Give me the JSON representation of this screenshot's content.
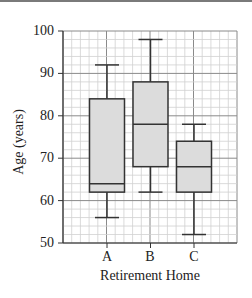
{
  "chart_data": {
    "type": "boxplot",
    "title": "",
    "xlabel": "Retirement Home",
    "ylabel": "Age (years)",
    "categories": [
      "A",
      "B",
      "C"
    ],
    "ylim": [
      50,
      100
    ],
    "yticks": [
      50,
      60,
      70,
      80,
      90,
      100
    ],
    "grid": true,
    "series": [
      {
        "name": "A",
        "min": 56,
        "q1": 62,
        "median": 64,
        "q3": 84,
        "max": 92
      },
      {
        "name": "B",
        "min": 62,
        "q1": 68,
        "median": 78,
        "q3": 88,
        "max": 98
      },
      {
        "name": "C",
        "min": 52,
        "q1": 62,
        "median": 68,
        "q3": 74,
        "max": 78
      }
    ],
    "box_fill": "#dcdcdc",
    "line_color": "#333333"
  },
  "labels": {
    "xlabel": "Retirement Home",
    "ylabel": "Age (years)",
    "yticks": [
      "50",
      "60",
      "70",
      "80",
      "90",
      "100"
    ],
    "xticks": [
      "A",
      "B",
      "C"
    ]
  }
}
